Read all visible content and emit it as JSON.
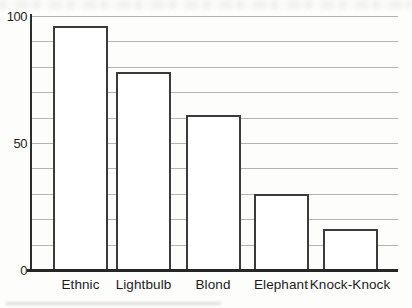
{
  "chart_data": {
    "type": "bar",
    "title": "",
    "xlabel": "",
    "ylabel": "",
    "categories": [
      "Ethnic",
      "Lightbulb",
      "Blond",
      "Elephant",
      "Knock-Knock"
    ],
    "values": [
      96,
      78,
      61,
      30,
      16
    ],
    "ylim": [
      0,
      100
    ],
    "ytick_step": 10,
    "yticks_labeled": [
      {
        "label": "100",
        "value": 100
      },
      {
        "label": "50",
        "value": 50
      },
      {
        "label": "0",
        "value": 0
      }
    ],
    "grid": "horizontal",
    "legend": "none",
    "colors": {
      "paper": "#fdfdfc",
      "bar_fill": "#ffffff",
      "bar_border": "#3b3b3b",
      "gridline": "#b4b4b4",
      "axis": "#2a2a2a",
      "text": "#1f1f1f"
    }
  }
}
